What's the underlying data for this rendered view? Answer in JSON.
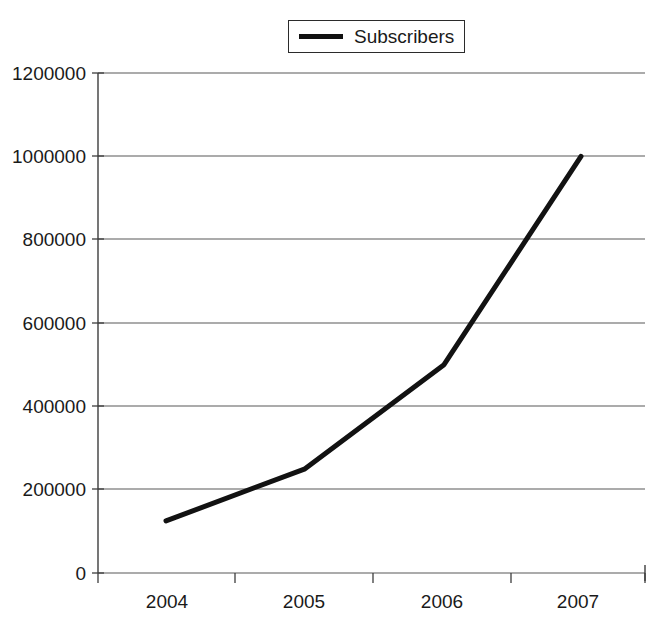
{
  "chart_data": {
    "type": "line",
    "title": "",
    "subtitle": "",
    "xlabel": "",
    "ylabel": "",
    "categories": [
      "2004",
      "2005",
      "2006",
      "2007"
    ],
    "series": [
      {
        "name": "Subscribers",
        "values": [
          125000,
          250000,
          500000,
          1000000
        ],
        "color": "#121212"
      }
    ],
    "ylim": [
      0,
      1200000
    ],
    "ytick_values": [
      0,
      200000,
      400000,
      600000,
      800000,
      1000000,
      1200000
    ],
    "ytick_labels": [
      "0",
      "200000",
      "400000",
      "600000",
      "800000",
      "1000000",
      "1200000"
    ],
    "xtick_labels": [
      "2004",
      "2005",
      "2006",
      "2007"
    ],
    "grid": true,
    "grid_axis": "y",
    "legend_position": "top-center",
    "legend_entries": [
      "Subscribers"
    ],
    "background_color": "#ffffff",
    "gridline_color": "#595959",
    "axis_color": "#3d3d3d"
  },
  "legend": {
    "label": "Subscribers",
    "swatch_name": "line-swatch"
  },
  "axes": {
    "y_labels": [
      "1200000",
      "1000000",
      "800000",
      "600000",
      "400000",
      "200000",
      "0"
    ],
    "x_labels": [
      "2004",
      "2005",
      "2006",
      "2007"
    ]
  }
}
